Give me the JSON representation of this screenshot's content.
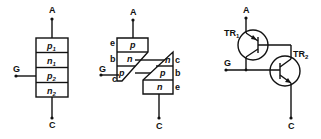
{
  "diagram": {
    "terminals": {
      "anode": "A",
      "gate": "G",
      "cathode": "C"
    },
    "layer_model": {
      "layers": [
        {
          "type": "p",
          "sub": "1"
        },
        {
          "type": "n",
          "sub": "1"
        },
        {
          "type": "p",
          "sub": "2"
        },
        {
          "type": "n",
          "sub": "2"
        }
      ]
    },
    "split_model": {
      "upper": {
        "layers": [
          "p",
          "n",
          "p"
        ],
        "labels": [
          "e",
          "b",
          "c"
        ]
      },
      "lower": {
        "layers": [
          "n",
          "p",
          "n"
        ],
        "labels": [
          "c",
          "b",
          "e"
        ]
      }
    },
    "transistor_model": {
      "tr1": {
        "name": "TR",
        "sub": "1",
        "type": "pnp"
      },
      "tr2": {
        "name": "TR",
        "sub": "2",
        "type": "npn"
      }
    }
  }
}
